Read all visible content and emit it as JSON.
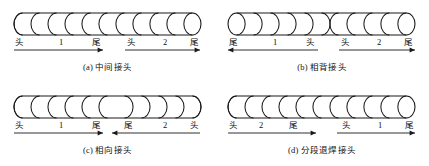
{
  "figure": {
    "title_present": false,
    "panel_count": 4,
    "stroke_color": "#1a1a1a",
    "background_color": "#ffffff"
  },
  "panels": [
    {
      "key": "a",
      "caption": "(a) 中间接头",
      "bead": {
        "arc_count": 11,
        "arc_direction": "left",
        "split_at": 6,
        "second_direction": "left"
      },
      "segments": [
        {
          "start_label": "头",
          "number": "1",
          "end_label": "尾",
          "arrow_direction": "right"
        },
        {
          "start_label": "头",
          "number": "2",
          "end_label": "尾",
          "arrow_direction": "right"
        }
      ]
    },
    {
      "key": "b",
      "caption": "(b) 相背接头",
      "bead": {
        "arc_count": 11,
        "arc_direction": "right",
        "split_at": 6,
        "second_direction": "left"
      },
      "segments": [
        {
          "start_label": "尾",
          "number": "1",
          "end_label": "头",
          "arrow_direction": "left"
        },
        {
          "start_label": "头",
          "number": "2",
          "end_label": "尾",
          "arrow_direction": "right"
        }
      ]
    },
    {
      "key": "c",
      "caption": "(c) 相向接头",
      "bead": {
        "arc_count": 11,
        "arc_direction": "left",
        "split_at": 6,
        "second_direction": "right"
      },
      "segments": [
        {
          "start_label": "头",
          "number": "1",
          "end_label": "尾",
          "arrow_direction": "right"
        },
        {
          "start_label": "尾",
          "number": "2",
          "end_label": "头",
          "arrow_direction": "left"
        }
      ]
    },
    {
      "key": "d",
      "caption": "(d) 分段退焊接头",
      "bead": {
        "arc_count": 11,
        "arc_direction": "left",
        "split_at": 6,
        "second_direction": "left"
      },
      "segments": [
        {
          "start_label": "头",
          "number": "2",
          "end_label": "尾",
          "arrow_direction": "right"
        },
        {
          "start_label": "头",
          "number": "1",
          "end_label": "尾",
          "arrow_direction": "right"
        }
      ]
    }
  ]
}
